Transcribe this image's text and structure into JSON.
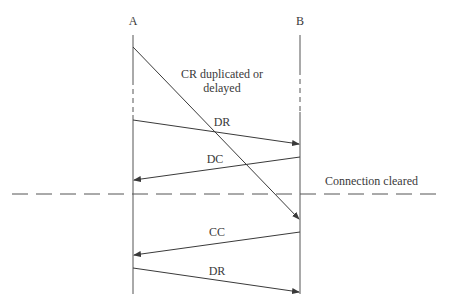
{
  "diagram": {
    "type": "sequence",
    "participants": [
      {
        "id": "A",
        "label": "A",
        "x": 133
      },
      {
        "id": "B",
        "label": "B",
        "x": 300
      }
    ],
    "annotation_cr": {
      "line1": "CR duplicated or",
      "line2": "delayed"
    },
    "messages": [
      {
        "label": "CR",
        "from": "A",
        "to": "B"
      },
      {
        "label": "DR",
        "from": "A",
        "to": "B"
      },
      {
        "label": "DC",
        "from": "B",
        "to": "A"
      },
      {
        "label": "CC",
        "from": "B",
        "to": "A"
      },
      {
        "label": "DR",
        "from": "A",
        "to": "B"
      }
    ],
    "divider_label": "Connection cleared",
    "colors": {
      "line": "#3a3a3a",
      "background": "#ffffff"
    }
  }
}
